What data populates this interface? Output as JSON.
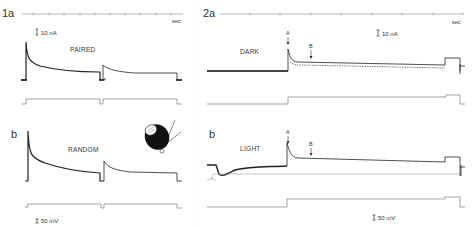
{
  "figure": {
    "panels": [
      {
        "id": "1a",
        "label": "1a",
        "condition": "PAIRED",
        "time_unit": "sec",
        "current_scale": "10 nA"
      },
      {
        "id": "1b",
        "label": "b",
        "condition": "RANDOM",
        "voltage_scale": "50 mV",
        "inset": "cell-with-electrodes-drawing"
      },
      {
        "id": "2a",
        "label": "2a",
        "condition": "DARK",
        "time_unit": "sec",
        "current_scale": "10 nA",
        "markers": [
          "A",
          "B"
        ]
      },
      {
        "id": "2b",
        "label": "b",
        "condition": "LIGHT",
        "voltage_scale": "50 mV",
        "markers": [
          "A",
          "B"
        ]
      }
    ],
    "colors": {
      "background": "#ffffff",
      "trace": "#333333"
    }
  }
}
